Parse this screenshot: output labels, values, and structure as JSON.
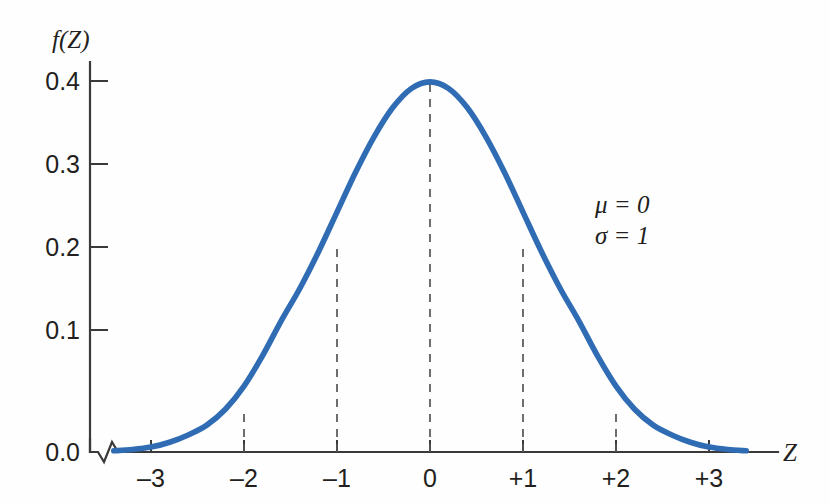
{
  "figure": {
    "background_color": "#fefefe",
    "curve_color": "#2f6cb3",
    "axis_color": "#3a3a3a",
    "dash_color": "#555555",
    "text_color": "#231f20"
  },
  "axes": {
    "y_title": "f(Z)",
    "x_title": "Z",
    "y_ticks": [
      "0.0",
      "0.1",
      "0.2",
      "0.3",
      "0.4"
    ],
    "x_ticks": [
      "–3",
      "–2",
      "–1",
      "0",
      "+1",
      "+2",
      "+3"
    ],
    "y_axis_break": true
  },
  "annotations": {
    "mu": "μ = 0",
    "sigma": "σ = 1"
  },
  "chart_data": {
    "type": "line",
    "title": "",
    "subtitle": "",
    "xlabel": "Z",
    "ylabel": "f(Z)",
    "xlim": [
      -3.6,
      3.6
    ],
    "ylim": [
      0.0,
      0.42
    ],
    "grid": false,
    "legend": null,
    "x_tick_values": [
      -3,
      -2,
      -1,
      0,
      1,
      2,
      3
    ],
    "x_tick_labels": [
      "–3",
      "–2",
      "–1",
      "0",
      "+1",
      "+2",
      "+3"
    ],
    "y_tick_values": [
      0.0,
      0.1,
      0.2,
      0.3,
      0.4
    ],
    "y_tick_labels": [
      "0.0",
      "0.1",
      "0.2",
      "0.3",
      "0.4"
    ],
    "series": [
      {
        "name": "Standard normal density",
        "color": "#2f6cb3",
        "x": [
          -3.4,
          -3.2,
          -3.0,
          -2.8,
          -2.6,
          -2.4,
          -2.2,
          -2.0,
          -1.8,
          -1.6,
          -1.4,
          -1.2,
          -1.0,
          -0.8,
          -0.6,
          -0.4,
          -0.2,
          0.0,
          0.2,
          0.4,
          0.6,
          0.8,
          1.0,
          1.2,
          1.4,
          1.6,
          1.8,
          2.0,
          2.2,
          2.4,
          2.6,
          2.8,
          3.0,
          3.2,
          3.4
        ],
        "y": [
          0.001,
          0.002,
          0.004,
          0.008,
          0.014,
          0.022,
          0.035,
          0.054,
          0.079,
          0.111,
          0.15,
          0.194,
          0.242,
          0.29,
          0.333,
          0.368,
          0.391,
          0.399,
          0.391,
          0.368,
          0.333,
          0.29,
          0.242,
          0.194,
          0.15,
          0.111,
          0.079,
          0.054,
          0.035,
          0.022,
          0.014,
          0.008,
          0.004,
          0.002,
          0.001
        ]
      }
    ],
    "reference_lines": [
      {
        "x": -2,
        "y_top": 0.054,
        "style": "dashed"
      },
      {
        "x": -1,
        "y_top": 0.242,
        "style": "dashed"
      },
      {
        "x": 0,
        "y_top": 0.399,
        "style": "dashed"
      },
      {
        "x": 1,
        "y_top": 0.242,
        "style": "dashed"
      },
      {
        "x": 2,
        "y_top": 0.054,
        "style": "dashed"
      }
    ],
    "annotations": [
      "μ = 0",
      "σ = 1"
    ]
  }
}
